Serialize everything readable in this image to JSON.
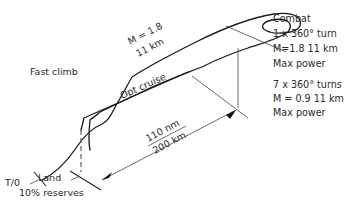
{
  "diagram": {
    "labels": {
      "takeoff": "T/0",
      "fast_climb": "Fast climb",
      "mach_climb": "M = 1.8",
      "alt_climb": "11 km",
      "opt_cruise": "Opt cruise",
      "distance_nm": "110 nm",
      "distance_km": "200 km",
      "land": "Land",
      "reserves": "10% reserves"
    },
    "combat_notes": [
      "Combat",
      "1 x 360° turn",
      "M=1.8  11 km",
      "Max power"
    ],
    "turn_notes": [
      "7  x 360° turns",
      "M = 0.9  11 km",
      "Max power"
    ],
    "line_color": "#1a1a1a"
  }
}
